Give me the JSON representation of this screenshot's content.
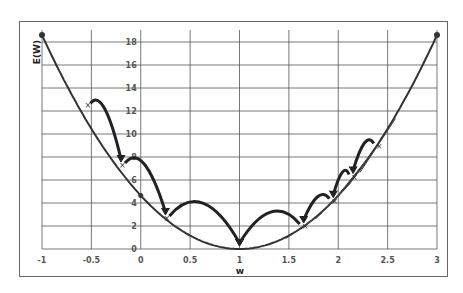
{
  "chart_data": {
    "type": "line",
    "title": "",
    "xlabel": "w",
    "ylabel": "E(W)",
    "xlim": [
      -1,
      3
    ],
    "ylim": [
      0,
      18
    ],
    "grid": true,
    "legend": null,
    "x_ticks": [
      "-1",
      "-0.5",
      "0",
      "0.5",
      "1",
      "1.5",
      "2",
      "2.5",
      "3"
    ],
    "y_ticks": [
      "0",
      "2",
      "4",
      "6",
      "8",
      "10",
      "12",
      "14",
      "16",
      "18"
    ],
    "series": [
      {
        "name": "E(w)",
        "description": "Convex error curve, approx E = 4.65*(w-1)^2, minimum at w=1",
        "x": [
          -1,
          -0.5,
          0,
          0.5,
          1,
          1.5,
          2,
          2.5,
          3
        ],
        "y": [
          18.6,
          10.5,
          4.65,
          1.16,
          0,
          1.16,
          4.65,
          10.5,
          18.6
        ]
      }
    ],
    "annotations": {
      "left_descent_steps": [
        {
          "w": -0.55,
          "E": 12.5
        },
        {
          "w": -0.2,
          "E": 7.3
        },
        {
          "w": 0.25,
          "E": 2.7
        },
        {
          "w": 1.0,
          "E": 0
        }
      ],
      "right_descent_steps": [
        {
          "w": 2.4,
          "E": 9.0
        },
        {
          "w": 2.15,
          "E": 6.3
        },
        {
          "w": 1.95,
          "E": 4.2
        },
        {
          "w": 1.65,
          "E": 2.0
        },
        {
          "w": 1.0,
          "E": 0
        }
      ],
      "note": "Curved arrows show gradient descent steps toward the minimum; tangent lines drawn at right-side points"
    }
  }
}
